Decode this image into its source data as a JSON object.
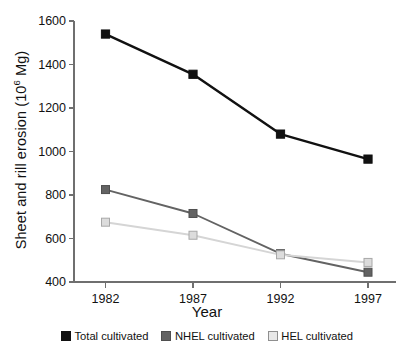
{
  "chart_data": {
    "type": "line",
    "title": "",
    "xlabel": "Year",
    "ylabel": "Sheet and rill erosion (10⁶ Mg)",
    "ylabel_main": "Sheet and rill erosion (10",
    "ylabel_sup": "6",
    "ylabel_tail": " Mg)",
    "categories": [
      "1982",
      "1987",
      "1992",
      "1997"
    ],
    "x": [
      1982,
      1987,
      1992,
      1997
    ],
    "xlim": [
      1980.2,
      1998.6
    ],
    "ylim": [
      400,
      1600
    ],
    "yticks": [
      "400",
      "600",
      "800",
      "1000",
      "1200",
      "1400",
      "1600"
    ],
    "ytick_values": [
      400,
      600,
      800,
      1000,
      1200,
      1400,
      1600
    ],
    "grid": false,
    "legend_position": "bottom",
    "marker": "square",
    "series": [
      {
        "name": "Total cultivated",
        "key": "total",
        "values": [
          1540,
          1355,
          1080,
          965
        ],
        "color": "#111111",
        "line_color": "#111111",
        "marker_fill": "#111111",
        "marker_edge": "#111111"
      },
      {
        "name": "NHEL cultivated",
        "key": "nhel",
        "values": [
          825,
          715,
          530,
          445
        ],
        "color": "#636363",
        "line_color": "#636363",
        "marker_fill": "#636363",
        "marker_edge": "#4f4f4f"
      },
      {
        "name": "HEL cultivated",
        "key": "hel",
        "values": [
          675,
          615,
          525,
          490
        ],
        "color": "#d5d5d5",
        "line_color": "#d5d5d5",
        "marker_fill": "#dcdcdc",
        "marker_edge": "#a8a8a8"
      }
    ]
  },
  "axes": {
    "axis_color": "#6f6f6f",
    "tick_color": "#6f6f6f"
  },
  "legend": {
    "items": [
      {
        "label": "Total cultivated",
        "swatch": "#111111",
        "border": "#111111"
      },
      {
        "label": "NHEL cultivated",
        "swatch": "#636363",
        "border": "#4f4f4f"
      },
      {
        "label": "HEL cultivated",
        "swatch": "#e8e8e8",
        "border": "#8f8f8f"
      }
    ]
  }
}
